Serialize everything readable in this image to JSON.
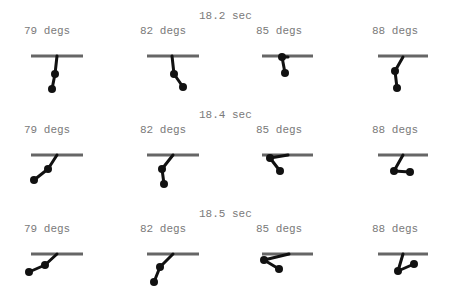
{
  "rows": [
    {
      "time_label": "18.2 sec",
      "time_pos": {
        "x": 199,
        "y": 10
      },
      "label_y": 25,
      "bar_y": 56,
      "panels": [
        {
          "label": "79 degs",
          "label_x": 24,
          "bar": [
            31,
            83
          ],
          "pivot": [
            57,
            56
          ],
          "joint": [
            55,
            74
          ],
          "bob": [
            52,
            89
          ]
        },
        {
          "label": "82 degs",
          "label_x": 140,
          "bar": [
            147,
            199
          ],
          "pivot": [
            172,
            56
          ],
          "joint": [
            174,
            74
          ],
          "bob": [
            183,
            87
          ]
        },
        {
          "label": "85 degs",
          "label_x": 256,
          "bar": [
            262,
            313
          ],
          "pivot": [
            288,
            57
          ],
          "joint": [
            282,
            57
          ],
          "bob": [
            285,
            73
          ]
        },
        {
          "label": "88 degs",
          "label_x": 372,
          "bar": [
            378,
            428
          ],
          "pivot": [
            403,
            57
          ],
          "joint": [
            395,
            71
          ],
          "bob": [
            397,
            88
          ]
        }
      ]
    },
    {
      "time_label": "18.4 sec",
      "time_pos": {
        "x": 199,
        "y": 109
      },
      "label_y": 124,
      "bar_y": 155,
      "panels": [
        {
          "label": "79 degs",
          "label_x": 24,
          "bar": [
            31,
            83
          ],
          "pivot": [
            57,
            155
          ],
          "joint": [
            48,
            169
          ],
          "bob": [
            34,
            180
          ]
        },
        {
          "label": "82 degs",
          "label_x": 140,
          "bar": [
            147,
            199
          ],
          "pivot": [
            173,
            155
          ],
          "joint": [
            162,
            169
          ],
          "bob": [
            164,
            184
          ]
        },
        {
          "label": "85 degs",
          "label_x": 256,
          "bar": [
            262,
            313
          ],
          "pivot": [
            288,
            155
          ],
          "joint": [
            270,
            158
          ],
          "bob": [
            280,
            171
          ]
        },
        {
          "label": "88 degs",
          "label_x": 372,
          "bar": [
            378,
            428
          ],
          "pivot": [
            403,
            155
          ],
          "joint": [
            394,
            171
          ],
          "bob": [
            410,
            172
          ]
        }
      ]
    },
    {
      "time_label": "18.5 sec",
      "time_pos": {
        "x": 199,
        "y": 208
      },
      "label_y": 223,
      "bar_y": 254,
      "panels": [
        {
          "label": "79 degs",
          "label_x": 24,
          "bar": [
            31,
            83
          ],
          "pivot": [
            57,
            254
          ],
          "joint": [
            45,
            265
          ],
          "bob": [
            29,
            272
          ]
        },
        {
          "label": "82 degs",
          "label_x": 140,
          "bar": [
            147,
            199
          ],
          "pivot": [
            173,
            254
          ],
          "joint": [
            160,
            267
          ],
          "bob": [
            154,
            282
          ]
        },
        {
          "label": "85 degs",
          "label_x": 256,
          "bar": [
            262,
            313
          ],
          "pivot": [
            289,
            254
          ],
          "joint": [
            264,
            260
          ],
          "bob": [
            279,
            269
          ]
        },
        {
          "label": "88 degs",
          "label_x": 372,
          "bar": [
            378,
            428
          ],
          "pivot": [
            403,
            254
          ],
          "joint": [
            398,
            271
          ],
          "bob": [
            414,
            264
          ]
        }
      ]
    }
  ],
  "colors": {
    "bar": "#666666",
    "arm": "#111111",
    "text": "#7a7a7a"
  }
}
